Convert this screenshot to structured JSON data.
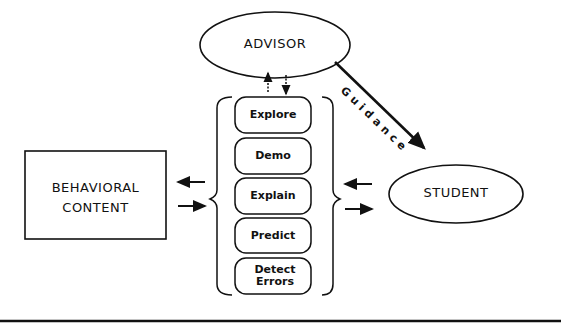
{
  "diagram": {
    "nodes": {
      "advisor": {
        "label": "ADVISOR",
        "shape": "ellipse"
      },
      "behavioral_content": {
        "label_line1": "BEHAVIORAL",
        "label_line2": "CONTENT",
        "shape": "rectangle"
      },
      "student": {
        "label": "STUDENT",
        "shape": "ellipse"
      }
    },
    "modes": [
      {
        "label": "Explore"
      },
      {
        "label": "Demo"
      },
      {
        "label": "Explain"
      },
      {
        "label": "Predict"
      },
      {
        "label_line1": "Detect",
        "label_line2": "Errors"
      }
    ],
    "edges": [
      {
        "from": "modes",
        "to": "advisor",
        "style": "dotted-up-arrow"
      },
      {
        "from": "advisor",
        "to": "modes",
        "style": "dotted-down-arrow"
      },
      {
        "from": "advisor",
        "to": "student",
        "label": "Guidance",
        "style": "thick-arrow"
      },
      {
        "from": "modes",
        "to": "behavioral_content",
        "style": "arrow"
      },
      {
        "from": "behavioral_content",
        "to": "modes",
        "style": "arrow"
      },
      {
        "from": "student",
        "to": "modes",
        "style": "arrow"
      },
      {
        "from": "modes",
        "to": "student",
        "style": "arrow"
      }
    ],
    "guidance_label": "Guidance"
  }
}
